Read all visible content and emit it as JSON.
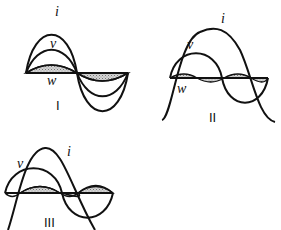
{
  "diagrams": [
    {
      "id": "I",
      "label": "I",
      "curves": {
        "current": "i",
        "voltage": "v",
        "power": "w"
      },
      "description": "in-phase: power always positive"
    },
    {
      "id": "II",
      "label": "II",
      "curves": {
        "current": "i",
        "voltage": "v",
        "power": "w"
      },
      "description": "current lags voltage by 90°: power alternates"
    },
    {
      "id": "III",
      "label": "III",
      "curves": {
        "current": "i",
        "voltage": "v"
      },
      "description": "current lags voltage by partial angle"
    }
  ],
  "colors": {
    "line": "#111111",
    "hatch": "#9a9a9a"
  }
}
